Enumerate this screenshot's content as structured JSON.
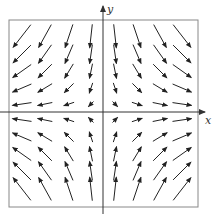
{
  "chart_data": {
    "type": "vector_field",
    "title": "",
    "xlabel": "x",
    "ylabel": "y",
    "field": "F(x, y) = (x, -y)",
    "grid": false,
    "frame": true,
    "x_samples": [
      -3.5,
      -2.5,
      -1.5,
      -0.5,
      0.5,
      1.5,
      2.5,
      3.5
    ],
    "y_samples": [
      4.5,
      3.5,
      2.5,
      1.5,
      0.5,
      -0.5,
      -1.5,
      -2.5,
      -3.5,
      -4.5
    ],
    "quadrant_directions": {
      "upper_left": "down-left",
      "upper_right": "down-right",
      "lower_left": "up-left",
      "lower_right": "up-right"
    }
  },
  "layout": {
    "frame": {
      "left": 9,
      "top": 20,
      "right": 198,
      "bottom": 207
    },
    "origin": {
      "x": 103,
      "y": 112
    },
    "x_axis": {
      "from": 0,
      "to": 205
    },
    "y_axis": {
      "from": 207,
      "to": 6
    },
    "col_px": [
      22,
      45,
      69,
      91,
      115,
      137,
      160,
      182
    ],
    "row_px": [
      36,
      54,
      71,
      88,
      104,
      120,
      137,
      154,
      171,
      189
    ],
    "colors": {
      "arrow": "#222222",
      "frame": "#888888",
      "axis": "#333333"
    }
  }
}
